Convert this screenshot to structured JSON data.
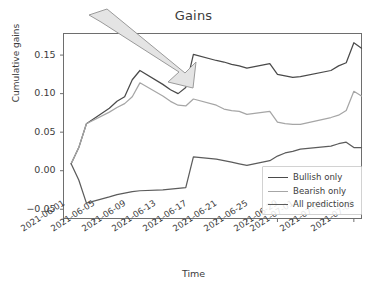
{
  "chart_data": {
    "type": "line",
    "title": "Gains",
    "xlabel": "Time",
    "ylabel": "Cumulative gains",
    "grid": false,
    "legend_position": "lower right",
    "ylim": [
      -0.062,
      0.178
    ],
    "yticks": [
      -0.05,
      0.0,
      0.05,
      0.1,
      0.15
    ],
    "ytick_labels": [
      "−0.05",
      "0.00",
      "0.05",
      "0.10",
      "0.15"
    ],
    "xlim": [
      "2021-06-01",
      "2021-07-10"
    ],
    "xtick_labels": [
      "2021-06-01",
      "2021-06-05",
      "2021-06-09",
      "2021-06-13",
      "2021-06-17",
      "2021-06-21",
      "2021-06-25",
      "2021-06-29",
      "2021-07-01",
      "2021-07-05",
      "2021-07-09"
    ],
    "x": [
      "2021-06-02",
      "2021-06-03",
      "2021-06-04",
      "2021-06-07",
      "2021-06-08",
      "2021-06-09",
      "2021-06-10",
      "2021-06-11",
      "2021-06-14",
      "2021-06-15",
      "2021-06-16",
      "2021-06-17",
      "2021-06-18",
      "2021-06-21",
      "2021-06-22",
      "2021-06-23",
      "2021-06-24",
      "2021-06-25",
      "2021-06-28",
      "2021-06-29",
      "2021-06-30",
      "2021-07-01",
      "2021-07-02",
      "2021-07-06",
      "2021-07-07",
      "2021-07-08",
      "2021-07-09"
    ],
    "series": [
      {
        "name": "Bullish only",
        "color": "#4a4a4a",
        "values": [
          0.009,
          0.03,
          0.061,
          0.081,
          0.09,
          0.096,
          0.118,
          0.13,
          0.112,
          0.105,
          0.1,
          0.108,
          0.151,
          0.143,
          0.141,
          0.138,
          0.136,
          0.133,
          0.139,
          0.125,
          0.123,
          0.121,
          0.122,
          0.13,
          0.136,
          0.14,
          0.166
        ],
        "final_value": 0.159
      },
      {
        "name": "Bearish only",
        "color": "#a6a6a6",
        "values": [
          0.009,
          0.03,
          0.061,
          0.076,
          0.082,
          0.087,
          0.096,
          0.114,
          0.097,
          0.09,
          0.085,
          0.084,
          0.093,
          0.085,
          0.08,
          0.078,
          0.077,
          0.073,
          0.077,
          0.063,
          0.061,
          0.06,
          0.06,
          0.069,
          0.072,
          0.078,
          0.103
        ],
        "final_value": 0.097
      },
      {
        "name": "All predictions",
        "color": "#5c5c5c",
        "values": [
          0.009,
          -0.012,
          -0.042,
          -0.034,
          -0.031,
          -0.029,
          -0.027,
          -0.026,
          -0.025,
          -0.024,
          -0.023,
          -0.022,
          0.018,
          0.015,
          0.013,
          0.011,
          0.009,
          0.007,
          0.013,
          0.019,
          0.023,
          0.025,
          0.028,
          0.032,
          0.035,
          0.037,
          0.03
        ],
        "final_value": 0.03
      }
    ],
    "annotations": [
      {
        "type": "block-arrow",
        "name": "callout-arrow",
        "color": "#e2e2e2",
        "stroke": "#8e8e8e",
        "direction": "down-right"
      }
    ]
  },
  "legend": {
    "items": [
      {
        "label": "Bullish only",
        "color": "#4a4a4a"
      },
      {
        "label": "Bearish only",
        "color": "#a6a6a6"
      },
      {
        "label": "All predictions",
        "color": "#5c5c5c"
      }
    ]
  }
}
